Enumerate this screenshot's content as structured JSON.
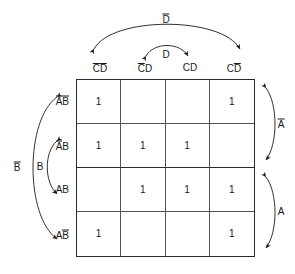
{
  "figure": {
    "kind": "karnaugh-map",
    "variables": [
      "A",
      "B",
      "C",
      "D"
    ],
    "rows": 4,
    "cols": 4
  },
  "columns": [
    {
      "id": "col-0",
      "text": "CD",
      "bars": "both",
      "x": 100
    },
    {
      "id": "col-1",
      "text": "CD",
      "bars": "first",
      "x": 145
    },
    {
      "id": "col-2",
      "text": "CD",
      "bars": "none",
      "x": 190
    },
    {
      "id": "col-3",
      "text": "CD",
      "bars": "second",
      "x": 234
    }
  ],
  "rows": [
    {
      "id": "row-0",
      "text": "AB",
      "bars": "both",
      "y": 101
    },
    {
      "id": "row-1",
      "text": "AB",
      "bars": "first",
      "y": 146
    },
    {
      "id": "row-2",
      "text": "AB",
      "bars": "none",
      "y": 190
    },
    {
      "id": "row-3",
      "text": "AB",
      "bars": "second",
      "y": 235
    }
  ],
  "cells": [
    [
      "1",
      "",
      "",
      "1"
    ],
    [
      "1",
      "1",
      "1",
      ""
    ],
    [
      "",
      "1",
      "1",
      "1"
    ],
    [
      "1",
      "",
      "",
      "1"
    ]
  ],
  "group_labels": {
    "d_not": {
      "text": "D",
      "bar": true,
      "x": 166,
      "y": 19
    },
    "d": {
      "text": "D",
      "bar": false,
      "x": 166,
      "y": 55
    },
    "a_not": {
      "text": "A",
      "bar": true,
      "x": 281,
      "y": 124
    },
    "a": {
      "text": "A",
      "bar": false,
      "x": 281,
      "y": 212
    },
    "b_not": {
      "text": "B",
      "bar": true,
      "x": 17,
      "y": 167
    },
    "b": {
      "text": "B",
      "bar": false,
      "x": 40,
      "y": 167
    }
  },
  "colors": {
    "ink": "#1a1a1a",
    "border": "#2b2b2b",
    "gridline": "#555555",
    "background": "#ffffff"
  }
}
